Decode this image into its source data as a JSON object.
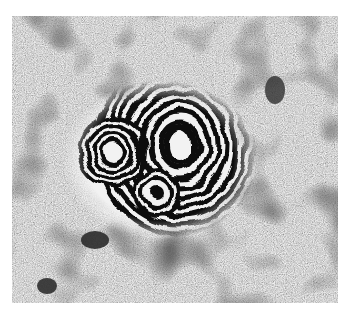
{
  "image": {
    "description": "Grayscale interferometric speckle fringe pattern with concentric black-and-white rings",
    "background_color": "#ffffff",
    "speckle_base": "#8a8a8a",
    "fringe_dark": "#0a0a0a",
    "fringe_light": "#f2f2f2",
    "frame": {
      "x": 12,
      "y": 16,
      "width": 326,
      "height": 287
    },
    "fringe_centers": [
      {
        "name": "large-ellipse",
        "cx": 180,
        "cy": 145,
        "rx": 14,
        "ry": 18
      },
      {
        "name": "left-ring",
        "cx": 113,
        "cy": 152,
        "r": 8
      },
      {
        "name": "small-ring",
        "cx": 157,
        "cy": 193,
        "r": 6
      }
    ]
  }
}
